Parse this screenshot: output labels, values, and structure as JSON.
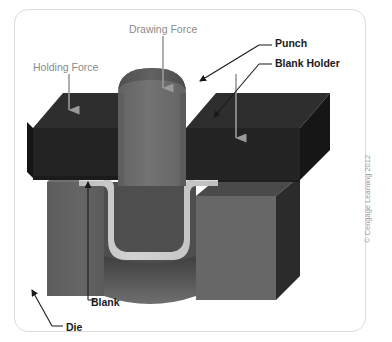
{
  "figure": {
    "copyright": "© Cengage Learning 2012"
  },
  "labels": {
    "drawing_force": "Drawing Force",
    "holding_force": "Holding Force",
    "punch": "Punch",
    "blank_holder": "Blank Holder",
    "blank": "Blank",
    "die": "Die"
  },
  "colors": {
    "background": "#ffffff",
    "card_border": "#dcdcdc",
    "blank_holder_top": "#2d2d2d",
    "blank_holder_front": "#242424",
    "blank_holder_side": "#1a1a1a",
    "punch_body": "#6e6e6e",
    "punch_top": "#5a5a5a",
    "die_front": "#5f5f5f",
    "die_side": "#2a2a2a",
    "die_top": "#4a4a4a",
    "blank_sheet": "#c8c8c8",
    "arrow_gray": "#9a9a9a",
    "label_gray": "#8a8a8a",
    "label_black": "#1a1a1a"
  },
  "parts": [
    {
      "name": "punch",
      "description": "rounded-top cylindrical punch descending into die cavity"
    },
    {
      "name": "blank-holder",
      "description": "dark flat slab clamping the sheet above the die"
    },
    {
      "name": "die",
      "description": "two-piece block with central cavity"
    },
    {
      "name": "blank",
      "description": "light gray sheet metal drawn into a U channel"
    }
  ],
  "arrows": [
    {
      "name": "drawing-force-arrow",
      "direction": "down",
      "target": "punch top"
    },
    {
      "name": "holding-force-arrow",
      "direction": "down",
      "target": "blank holder left"
    },
    {
      "name": "blank-holder-force-arrow",
      "direction": "down",
      "target": "blank holder right"
    },
    {
      "name": "punch-leader",
      "direction": "down-left",
      "target": "punch edge"
    },
    {
      "name": "blank-holder-leader",
      "direction": "down-left",
      "target": "blank holder edge"
    },
    {
      "name": "blank-leader",
      "direction": "up",
      "target": "blank sheet"
    },
    {
      "name": "die-leader",
      "direction": "up-right",
      "target": "die block"
    }
  ]
}
